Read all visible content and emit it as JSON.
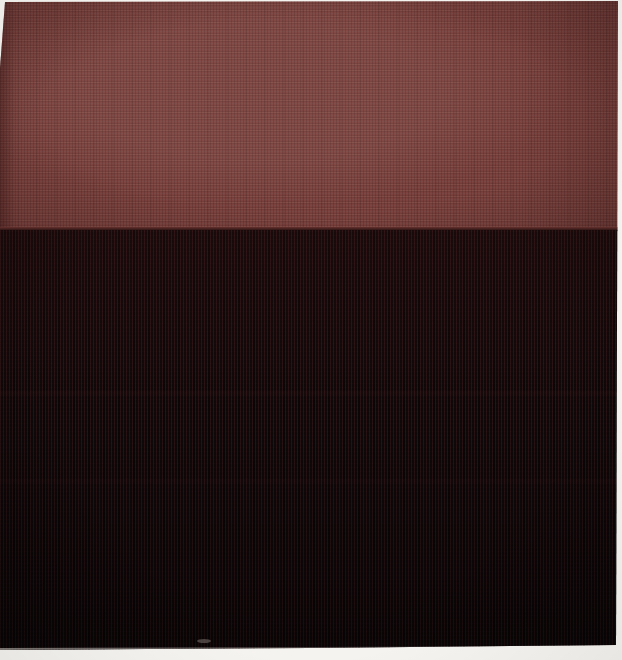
{
  "scene": {
    "type": "photograph",
    "description": "Close-up photograph of a two-panel textile artwork: a matte brick-red woven cloth band across the top third joined at a horizontal seam to a near-black finely ribbed cloth filling the rest, photographed on a white background with thin white margins visible at the top, right and bottom edges",
    "regions": {
      "red_band": "upper band, flat muted brick red with fine cross-weave texture",
      "black_band": "lower band, near-black with faint dark-red vertical ribs, darkest toward the bottom",
      "seam": "straight horizontal join between the two cloths at roughly one-third height",
      "margins": "white photo backdrop slivers: top edge, right edge, bottom edge, and upper-left corner",
      "speck": "small pale dust speck near the bottom hem, left of center"
    }
  },
  "palette": {
    "background": "#f4f3ef",
    "red_panel": "#7c413d",
    "red_panel_highlight": "#8d4f4b",
    "red_panel_shadow": "#5e2f2c",
    "black_panel": "#140b0d",
    "black_panel_rib": "#2a1113",
    "black_panel_deep": "#0a0607",
    "edge_light": "#d8d3cc",
    "speck": "#7a726d"
  }
}
